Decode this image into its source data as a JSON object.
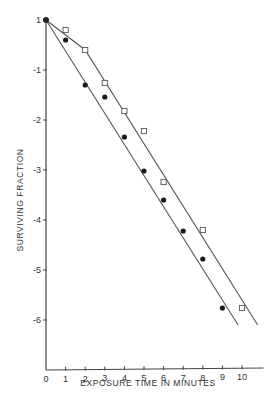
{
  "chart_data": {
    "type": "line",
    "title": "",
    "xlabel": "EXPOSURE TIME IN MINUTES",
    "ylabel": "SURVIVING FRACTION",
    "x_ticks": [
      "0",
      "1",
      "2",
      "3",
      "4",
      "5",
      "6",
      "7",
      "8",
      "9",
      "10"
    ],
    "y_ticks": [
      "1",
      "-1",
      "-2",
      "-3",
      "-4",
      "-5",
      "-6"
    ],
    "y_scale": "log10 (labels are exponents; 1 = 10^0)",
    "xlim": [
      0,
      11
    ],
    "ylim": [
      -7,
      0
    ],
    "grid": false,
    "legend": null,
    "series": [
      {
        "name": "open squares",
        "marker": "square-open",
        "x": [
          0,
          1,
          2,
          3,
          4,
          5,
          6,
          8,
          10
        ],
        "y": [
          0,
          -0.2,
          -0.6,
          -1.26,
          -1.82,
          -2.22,
          -3.24,
          -4.2,
          -5.76
        ]
      },
      {
        "name": "filled circles",
        "marker": "circle-filled",
        "x": [
          0,
          1,
          2,
          3,
          4,
          5,
          6,
          7,
          8,
          9
        ],
        "y": [
          0,
          -0.4,
          -1.3,
          -1.54,
          -2.34,
          -3.02,
          -3.6,
          -4.22,
          -4.78,
          -5.76
        ]
      }
    ],
    "fit_lines": [
      {
        "name": "squares fit (shouldered)",
        "points": [
          [
            0,
            0
          ],
          [
            2,
            -0.6
          ],
          [
            10.8,
            -6.1
          ]
        ]
      },
      {
        "name": "circles fit",
        "points": [
          [
            0,
            0
          ],
          [
            9.8,
            -6.1
          ]
        ]
      }
    ]
  },
  "labels": {
    "xlabel": "EXPOSURE TIME IN MINUTES",
    "ylabel": "SURVIVING FRACTION"
  }
}
